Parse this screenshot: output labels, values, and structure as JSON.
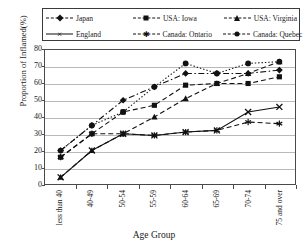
{
  "chart_data": {
    "type": "line",
    "title": "",
    "xlabel": "Age Group",
    "ylabel": "Proportion of Inflamed(%)",
    "categories": [
      "less than 40",
      "40-49",
      "50-54",
      "55-59",
      "60-64",
      "65-69",
      "70-74",
      "75 and over"
    ],
    "ylim": [
      0,
      80
    ],
    "yticks": [
      0,
      10,
      20,
      30,
      40,
      50,
      60,
      70,
      80
    ],
    "grid": true,
    "legend_position": "top",
    "series": [
      {
        "name": "Japan",
        "marker": "diamond",
        "line": "dash-dot",
        "values": [
          20,
          35,
          50,
          58,
          66,
          66,
          66,
          68
        ]
      },
      {
        "name": "USA: Iowa",
        "marker": "square",
        "line": "dashed",
        "values": [
          16,
          30,
          43,
          47,
          59,
          60,
          60,
          64
        ]
      },
      {
        "name": "USA: Virginia",
        "marker": "triangle",
        "line": "dashed",
        "values": [
          4,
          20,
          30,
          40,
          51,
          60,
          66,
          73
        ]
      },
      {
        "name": "England",
        "marker": "cross",
        "line": "solid",
        "values": [
          4,
          20,
          30,
          29,
          31,
          32,
          43,
          46
        ]
      },
      {
        "name": "Canada: Ontario",
        "marker": "star",
        "line": "dashed",
        "values": [
          16,
          30,
          30,
          29,
          31,
          32,
          37,
          36
        ]
      },
      {
        "name": "Canada: Quebec",
        "marker": "circle",
        "line": "dotted",
        "values": [
          20,
          35,
          43,
          58,
          72,
          66,
          72,
          73
        ]
      }
    ]
  },
  "legend": {
    "items": [
      {
        "label": "Japan",
        "marker": "diamond",
        "line": "dash-dot"
      },
      {
        "label": "USA: Iowa",
        "marker": "square",
        "line": "dashed"
      },
      {
        "label": "USA: Virginia",
        "marker": "triangle",
        "line": "dashed"
      },
      {
        "label": "England",
        "marker": "cross",
        "line": "solid"
      },
      {
        "label": "Canada: Ontario",
        "marker": "star",
        "line": "dashed"
      },
      {
        "label": "Canada: Quebec",
        "marker": "circle",
        "line": "dotted"
      }
    ]
  },
  "colors": {
    "series": "#111111",
    "grid": "#b9b9b9",
    "axis": "#4a4a4a",
    "background": "#ffffff"
  }
}
